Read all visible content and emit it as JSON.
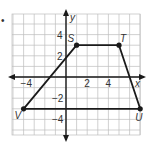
{
  "bullet": "•",
  "axes": {
    "x_label": "x",
    "y_label": "y",
    "x_ticks": [
      {
        "value": -4,
        "label": "−4"
      },
      {
        "value": 2,
        "label": "2"
      },
      {
        "value": 4,
        "label": "4"
      }
    ],
    "y_ticks": [
      {
        "value": 4,
        "label": "4"
      },
      {
        "value": 2,
        "label": "2"
      },
      {
        "value": -2,
        "label": "−2"
      },
      {
        "value": -4,
        "label": "−4"
      }
    ]
  },
  "grid": {
    "x_min": -5,
    "x_max": 7,
    "y_min": -5.5,
    "y_max": 6,
    "step": 1
  },
  "polygon": {
    "name": "STUV",
    "vertices": [
      {
        "label": "S",
        "x": 1,
        "y": 3
      },
      {
        "label": "T",
        "x": 5,
        "y": 3
      },
      {
        "label": "U",
        "x": 7,
        "y": -3
      },
      {
        "label": "V",
        "x": -4,
        "y": -3
      }
    ]
  },
  "colors": {
    "grid": "#bdbdbd",
    "axis": "#1a1a1a",
    "shape": "#1a1a1a"
  }
}
